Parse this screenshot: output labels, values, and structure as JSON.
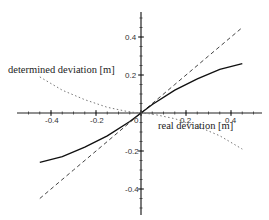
{
  "chart_data": {
    "type": "line",
    "title": "",
    "xlabel": "real deviation [m]",
    "ylabel": "determined deviation [m]",
    "xlim": [
      -0.5,
      0.5
    ],
    "ylim": [
      -0.55,
      0.5
    ],
    "grid": false,
    "axes_style": "centered-at-origin",
    "x_ticks": [
      -0.4,
      -0.2,
      0,
      0.2,
      0.4
    ],
    "x_tick_labels": [
      "-0.4",
      "-0.2",
      "0",
      "0.2",
      "0.4"
    ],
    "y_ticks": [
      -0.4,
      -0.2,
      0.2,
      0.4
    ],
    "y_tick_labels": [
      "-0.4",
      "-0.2",
      "0.2",
      "0.4"
    ],
    "series": [
      {
        "name": "ideal (y = x)",
        "style": "dashed",
        "color": "#444444",
        "x": [
          -0.45,
          -0.3,
          -0.15,
          0,
          0.15,
          0.3,
          0.45
        ],
        "y": [
          -0.45,
          -0.3,
          -0.15,
          0,
          0.15,
          0.3,
          0.45
        ]
      },
      {
        "name": "determined deviation",
        "style": "solid",
        "color": "#111111",
        "x": [
          -0.45,
          -0.35,
          -0.25,
          -0.15,
          -0.05,
          0,
          0.05,
          0.15,
          0.25,
          0.35,
          0.45
        ],
        "y": [
          -0.26,
          -0.23,
          -0.18,
          -0.12,
          -0.045,
          0,
          0.045,
          0.12,
          0.18,
          0.23,
          0.26
        ]
      },
      {
        "name": "error",
        "style": "dotted",
        "color": "#777777",
        "x": [
          -0.45,
          -0.35,
          -0.25,
          -0.15,
          -0.05,
          0,
          0.05,
          0.15,
          0.25,
          0.35,
          0.45
        ],
        "y": [
          0.19,
          0.12,
          0.07,
          0.03,
          0.005,
          0,
          -0.005,
          -0.03,
          -0.07,
          -0.12,
          -0.19
        ]
      }
    ],
    "legend": "none"
  },
  "labels": {
    "ylabel": "determined deviation [m]",
    "xlabel": "real deviation [m]"
  }
}
